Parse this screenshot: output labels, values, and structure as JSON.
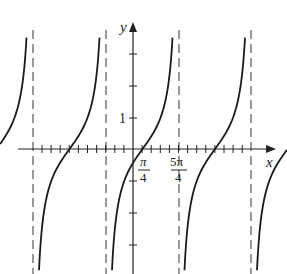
{
  "figure": {
    "type": "function-graph",
    "function_description": "periodic tangent-type curve with vertical asymptotes",
    "axes": {
      "x_label": "x",
      "y_label": "y",
      "y_tick_label": "1",
      "x_tick_labels": [
        {
          "num": "π",
          "den": "4"
        },
        {
          "num": "5π",
          "den": "4"
        }
      ]
    },
    "colors": {
      "curve": "#1a1a1a",
      "axis": "#222222",
      "asymptote": "#333333"
    }
  }
}
